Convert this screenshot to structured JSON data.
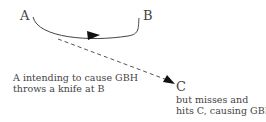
{
  "nodes": {
    "a": {
      "label": "A"
    },
    "b": {
      "label": "B"
    },
    "c": {
      "label": "C"
    }
  },
  "notes": {
    "a_note_line1": "A intending to cause GBH",
    "a_note_line2": "throws a knife at B",
    "c_note_line1": "but misses and",
    "c_note_line2": "hits C, causing GBH"
  },
  "edges": [
    {
      "from": "A",
      "to": "B",
      "style": "solid-curved",
      "meaning": "intended throw"
    },
    {
      "from": "A",
      "to": "C",
      "style": "dashed",
      "meaning": "actual outcome"
    }
  ],
  "colors": {
    "line": "#333333",
    "text": "#444444"
  }
}
